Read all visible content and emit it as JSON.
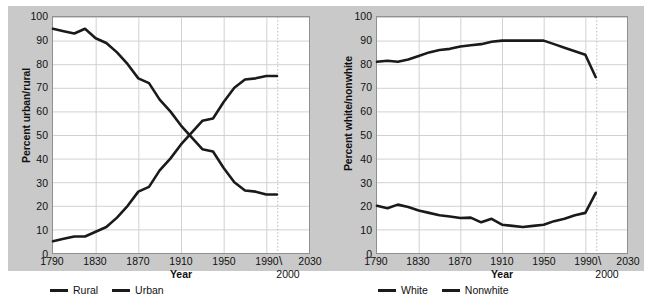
{
  "figure": {
    "background_color": "#c9c9c9",
    "plot_background": "#ffffff",
    "line_color": "#1a1a1a",
    "grid_color": "#d0d0d0"
  },
  "charts": [
    {
      "id": "urban-rural",
      "ylabel": "Percent urban/rural",
      "xlabel": "Year",
      "yticks": [
        "100",
        "90",
        "80",
        "70",
        "60",
        "50",
        "40",
        "30",
        "20",
        "10",
        "0"
      ],
      "xticks": [
        "1790",
        "1830",
        "1870",
        "1910",
        "1950",
        "1990",
        "2030"
      ],
      "callout": "2000",
      "callout_slash": "\\",
      "legend": [
        {
          "label": "Rural",
          "swatch": "line-swatch"
        },
        {
          "label": "Urban",
          "swatch": "line-swatch"
        }
      ]
    },
    {
      "id": "white-nonwhite",
      "ylabel": "Percent white/nonwhite",
      "xlabel": "Year",
      "yticks": [
        "100",
        "90",
        "80",
        "70",
        "60",
        "50",
        "40",
        "30",
        "20",
        "10",
        "0"
      ],
      "xticks": [
        "1790",
        "1830",
        "1870",
        "1910",
        "1950",
        "1990",
        "2030"
      ],
      "callout": "2000",
      "callout_slash": "\\",
      "legend": [
        {
          "label": "White",
          "swatch": "line-swatch"
        },
        {
          "label": "Nonwhite",
          "swatch": "line-swatch"
        }
      ]
    }
  ],
  "chart_data": [
    {
      "type": "line",
      "title": "",
      "xlabel": "Year",
      "ylabel": "Percent urban/rural",
      "xlim": [
        1790,
        2030
      ],
      "ylim": [
        0,
        100
      ],
      "xticks": [
        1790,
        1830,
        1870,
        1910,
        1950,
        1990,
        2030
      ],
      "yticks": [
        0,
        10,
        20,
        30,
        40,
        50,
        60,
        70,
        80,
        90,
        100
      ],
      "grid": true,
      "legend_position": "below",
      "annotations": [
        {
          "text": "2000",
          "x": 2000,
          "note": "dotted vertical reference line at year 2000 with leader slash to label"
        }
      ],
      "x": [
        1790,
        1800,
        1810,
        1820,
        1830,
        1840,
        1850,
        1860,
        1870,
        1880,
        1890,
        1900,
        1910,
        1920,
        1930,
        1940,
        1950,
        1960,
        1970,
        1980,
        1990,
        2000
      ],
      "series": [
        {
          "name": "Rural",
          "values": [
            95,
            94,
            93,
            95,
            91,
            89,
            85,
            80,
            74,
            72,
            65,
            60,
            54,
            49,
            44,
            43,
            36,
            30,
            26.5,
            26,
            24.8,
            24.8
          ]
        },
        {
          "name": "Urban",
          "values": [
            5,
            6,
            7,
            7,
            9,
            11,
            15,
            20,
            26,
            28,
            35,
            40,
            46,
            51,
            56,
            57,
            64,
            70,
            73.5,
            74,
            75,
            75
          ]
        }
      ]
    },
    {
      "type": "line",
      "title": "",
      "xlabel": "Year",
      "ylabel": "Percent white/nonwhite",
      "xlim": [
        1790,
        2030
      ],
      "ylim": [
        0,
        100
      ],
      "xticks": [
        1790,
        1830,
        1870,
        1910,
        1950,
        1990,
        2030
      ],
      "yticks": [
        0,
        10,
        20,
        30,
        40,
        50,
        60,
        70,
        80,
        90,
        100
      ],
      "grid": true,
      "legend_position": "below",
      "annotations": [
        {
          "text": "2000",
          "x": 2000,
          "note": "dotted vertical reference line at year 2000 with leader slash to label"
        }
      ],
      "x": [
        1790,
        1800,
        1810,
        1820,
        1830,
        1840,
        1850,
        1860,
        1870,
        1880,
        1890,
        1900,
        1910,
        1920,
        1930,
        1940,
        1950,
        1960,
        1970,
        1980,
        1990,
        2000
      ],
      "series": [
        {
          "name": "White",
          "values": [
            81,
            81.5,
            81,
            82,
            83.5,
            85,
            86,
            86.5,
            87.5,
            88,
            88.5,
            89.5,
            90,
            90,
            90,
            90,
            90,
            88.5,
            87,
            85.5,
            84,
            74.5
          ]
        },
        {
          "name": "Nonwhite",
          "values": [
            20,
            19,
            20.5,
            19.5,
            18,
            17,
            16,
            15.5,
            14.8,
            15,
            13,
            14.5,
            12,
            11.5,
            11,
            11.5,
            12,
            13.5,
            14.5,
            16,
            17,
            25.5
          ]
        }
      ]
    }
  ]
}
